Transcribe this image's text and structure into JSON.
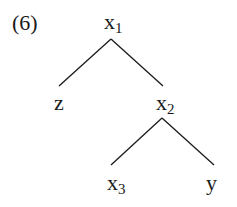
{
  "example_number": "(6)",
  "tree": {
    "root": {
      "base": "x",
      "sub": "1"
    },
    "left_child": {
      "base": "z",
      "sub": ""
    },
    "right_child": {
      "base": "x",
      "sub": "2"
    },
    "right_left_child": {
      "base": "x",
      "sub": "3"
    },
    "right_right_child": {
      "base": "y",
      "sub": ""
    }
  },
  "colors": {
    "ink": "#1a1a1a",
    "background": "#ffffff"
  }
}
